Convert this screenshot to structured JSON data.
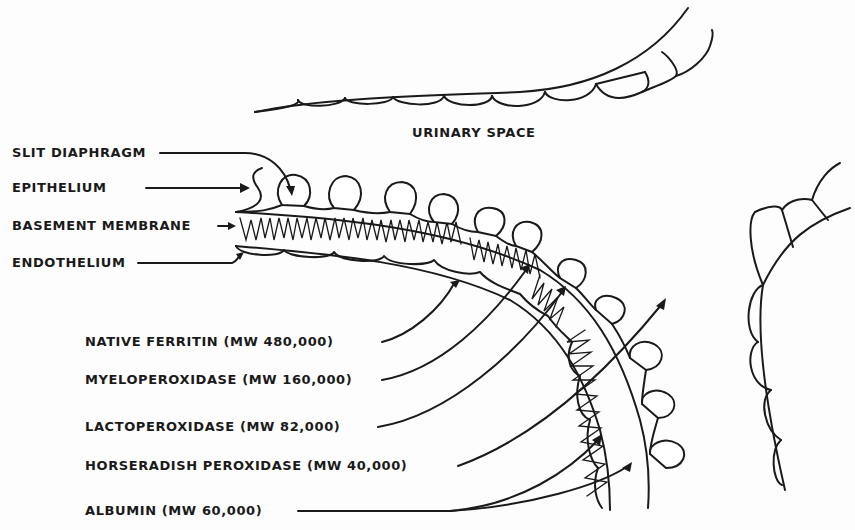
{
  "diagram": {
    "region_label": "URINARY SPACE",
    "structure_labels": [
      {
        "id": "slit-diaphragm",
        "text": "SLIT DIAPHRAGM"
      },
      {
        "id": "epithelium",
        "text": "EPITHELIUM"
      },
      {
        "id": "basement-membrane",
        "text": "BASEMENT MEMBRANE"
      },
      {
        "id": "endothelium",
        "text": "ENDOTHELIUM"
      }
    ],
    "tracers": [
      {
        "id": "native-ferritin",
        "text": "NATIVE FERRITIN (MW 480,000)",
        "name": "NATIVE FERRITIN",
        "mw": "480,000",
        "stops_at": "basement membrane (inner)"
      },
      {
        "id": "myeloperoxidase",
        "text": "MYELOPEROXIDASE (MW 160,000)",
        "name": "MYELOPEROXIDASE",
        "mw": "160,000",
        "stops_at": "basement membrane"
      },
      {
        "id": "lactoperoxidase",
        "text": "LACTOPEROXIDASE (MW 82,000)",
        "name": "LACTOPEROXIDASE",
        "mw": "82,000",
        "stops_at": "slit diaphragm"
      },
      {
        "id": "horseradish-peroxidase",
        "text": "HORSERADISH PEROXIDASE (MW 40,000)",
        "name": "HORSERADISH PEROXIDASE",
        "mw": "40,000",
        "stops_at": "urinary space (passes through)"
      },
      {
        "id": "albumin",
        "text": "ALBUMIN (MW 60,000)",
        "name": "ALBUMIN",
        "mw": "60,000",
        "stops_at": "endothelium / basement membrane"
      }
    ]
  }
}
